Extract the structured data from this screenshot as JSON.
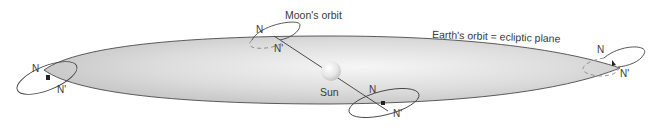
{
  "diagram": {
    "labels": {
      "moons_orbit": "Moon's orbit",
      "earths_orbit": "Earth's orbit = ecliptic plane",
      "sun": "Sun"
    },
    "node_labels": {
      "ascending": "N",
      "descending": "N'"
    },
    "positions": [
      {
        "id": "left",
        "node_n": "N",
        "node_n_prime": "N'"
      },
      {
        "id": "top",
        "node_n": "N",
        "node_n_prime": "N'"
      },
      {
        "id": "bottom",
        "node_n": "N",
        "node_n_prime": "N'"
      },
      {
        "id": "right",
        "node_n": "N",
        "node_n_prime": "N'"
      }
    ],
    "colors": {
      "plane_fill_center": "#f4f4f4",
      "plane_fill_edge": "#c9c9c9",
      "outline": "#3f3f3f",
      "text": "#3a3a3a",
      "sun": "#e8e8e8"
    }
  }
}
